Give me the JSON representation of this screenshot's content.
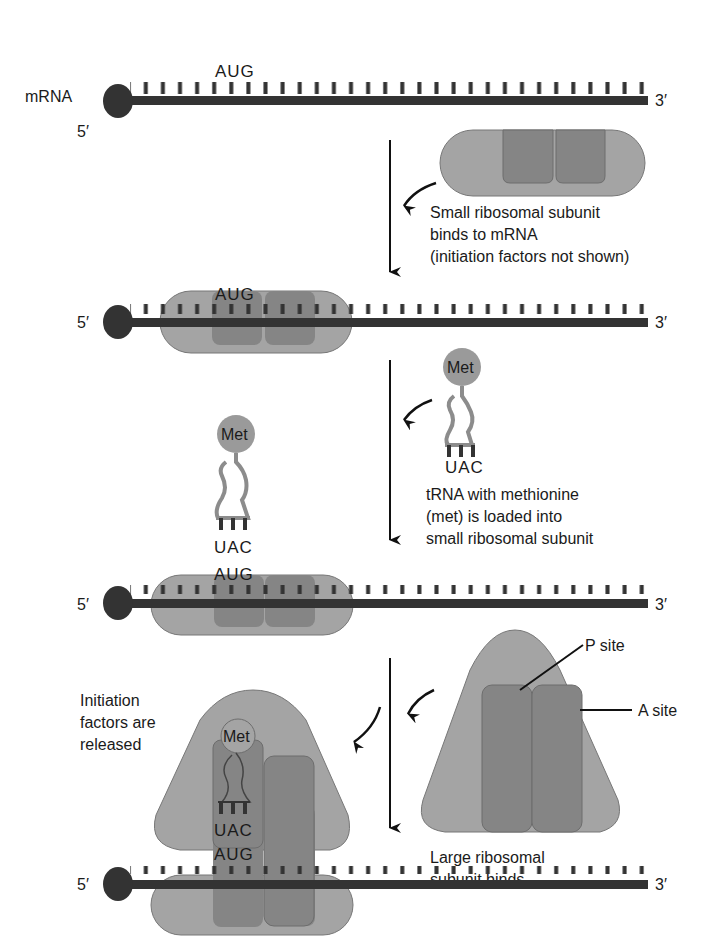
{
  "diagram": {
    "colors": {
      "mrna": "#333333",
      "ribosome_light": "#a4a4a4",
      "ribosome_dark": "#858585",
      "trna": "#8c8c8c",
      "met": "#9a9a9a",
      "arrow": "#111111",
      "background": "#ffffff"
    },
    "mrna_label": "mRNA",
    "five_prime": "5′",
    "three_prime": "3′",
    "start_codon": "AUG",
    "anticodon": "UAC",
    "met_label": "Met",
    "steps": [
      {
        "caption": [
          "Small ribosomal subunit",
          "binds to mRNA",
          "(initiation factors not shown)"
        ]
      },
      {
        "caption": [
          "tRNA with methionine",
          "(met) is loaded into",
          "small ribosomal subunit"
        ]
      },
      {
        "caption": [
          "Large ribosomal",
          "subunit binds"
        ]
      }
    ],
    "released_caption": [
      "Initiation",
      "factors are",
      "released"
    ],
    "site_labels": {
      "p_site": "P site",
      "a_site": "A site"
    }
  }
}
